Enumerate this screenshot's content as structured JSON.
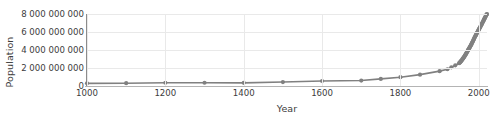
{
  "chart_data": {
    "type": "line",
    "title": "",
    "xlabel": "Year",
    "ylabel": "Population",
    "xlim": [
      1000,
      2021
    ],
    "ylim": [
      0,
      8000000000
    ],
    "grid": true,
    "legend": null,
    "series_color": "#808080",
    "marker": "circle",
    "xticks": [
      1000,
      1200,
      1400,
      1600,
      1800,
      2000
    ],
    "xtick_labels": [
      "1000",
      "1200",
      "1400",
      "1600",
      "1800",
      "2000"
    ],
    "yticks": [
      0,
      2000000000,
      4000000000,
      6000000000,
      8000000000
    ],
    "ytick_labels": [
      "0",
      "2 000 000 000",
      "4 000 000 000",
      "6 000 000 000",
      "8 000 000 000"
    ],
    "x": [
      1000,
      1100,
      1200,
      1300,
      1400,
      1500,
      1600,
      1700,
      1750,
      1800,
      1850,
      1900,
      1920,
      1930,
      1940,
      1950,
      1951,
      1952,
      1953,
      1954,
      1955,
      1956,
      1957,
      1958,
      1959,
      1960,
      1961,
      1962,
      1963,
      1964,
      1965,
      1966,
      1967,
      1968,
      1969,
      1970,
      1971,
      1972,
      1973,
      1974,
      1975,
      1976,
      1977,
      1978,
      1979,
      1980,
      1981,
      1982,
      1983,
      1984,
      1985,
      1986,
      1987,
      1988,
      1989,
      1990,
      1991,
      1992,
      1993,
      1994,
      1995,
      1996,
      1997,
      1998,
      1999,
      2000,
      2001,
      2002,
      2003,
      2004,
      2005,
      2006,
      2007,
      2008,
      2009,
      2010,
      2011,
      2012,
      2013,
      2014,
      2015,
      2016,
      2017,
      2018,
      2019,
      2020,
      2021
    ],
    "values": [
      295000000,
      310000000,
      360000000,
      360000000,
      350000000,
      438000000,
      556000000,
      603000000,
      791000000,
      978000000,
      1262000000,
      1650000000,
      1860000000,
      2070000000,
      2300000000,
      2536000000,
      2584000000,
      2630000000,
      2677000000,
      2726000000,
      2778000000,
      2832000000,
      2890000000,
      2950000000,
      3012000000,
      3072000000,
      3127000000,
      3193000000,
      3262000000,
      3331000000,
      3399000000,
      3469000000,
      3541000000,
      3615000000,
      3691000000,
      3770000000,
      3850000000,
      3928000000,
      4005000000,
      4080000000,
      4155000000,
      4229000000,
      4304000000,
      4380000000,
      4459000000,
      4540000000,
      4623000000,
      4709000000,
      4797000000,
      4885000000,
      4975000000,
      5067000000,
      5161000000,
      5255000000,
      5348000000,
      5438000000,
      5527000000,
      5613000000,
      5697000000,
      5780000000,
      5861000000,
      5942000000,
      6022000000,
      6102000000,
      6181000000,
      6260000000,
      6339000000,
      6418000000,
      6498000000,
      6578000000,
      6659000000,
      6741000000,
      6824000000,
      6908000000,
      6993000000,
      7079000000,
      7166000000,
      7254000000,
      7342000000,
      7430000000,
      7518000000,
      7605000000,
      7692000000,
      7778000000,
      7864000000,
      7950000000,
      8000000000
    ],
    "marker_years": [
      1000,
      1100,
      1200,
      1300,
      1400,
      1500,
      1600,
      1700,
      1750,
      1800,
      1850,
      1900,
      1920,
      1930,
      1940,
      1950,
      1951,
      1952,
      1953,
      1954,
      1955,
      1956,
      1957,
      1958,
      1959,
      1960,
      1961,
      1962,
      1963,
      1964,
      1965,
      1966,
      1967,
      1968,
      1969,
      1970,
      1971,
      1972,
      1973,
      1974,
      1975,
      1976,
      1977,
      1978,
      1979,
      1980,
      1981,
      1982,
      1983,
      1984,
      1985,
      1986,
      1987,
      1988,
      1989,
      1990,
      1991,
      1992,
      1993,
      1994,
      1995,
      1996,
      1997,
      1998,
      1999,
      2000,
      2001,
      2002,
      2003,
      2004,
      2005,
      2006,
      2007,
      2008,
      2009,
      2010,
      2011,
      2012,
      2013,
      2014,
      2015,
      2016,
      2017,
      2018,
      2019,
      2020,
      2021
    ]
  }
}
